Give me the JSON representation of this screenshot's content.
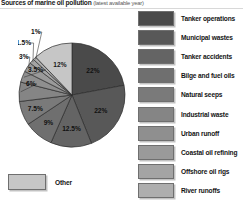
{
  "title": {
    "main": "Sources of marine oil pollution",
    "sub": "(latest available year)"
  },
  "chart_data": {
    "type": "pie",
    "title": "Sources of marine oil pollution (latest available year)",
    "xlabel": "",
    "ylabel": "",
    "legend_position": "right",
    "grid": false,
    "units": "percent",
    "categories": [
      "Tanker operations",
      "Municipal wastes",
      "Tanker accidents",
      "Bilge and fuel oils",
      "Natural seeps",
      "Industrial waste",
      "Urban runoff",
      "Coastal oil refining",
      "Offshore oil rigs",
      "River runoffs",
      "Other"
    ],
    "values": [
      22,
      22,
      12.5,
      9,
      7.5,
      6,
      3.5,
      3,
      1.5,
      1,
      12
    ],
    "labels": [
      "22%",
      "22%",
      "12.5%",
      "9%",
      "7.5%",
      "6%",
      "3.5%",
      "3%",
      "1.5%",
      "1%",
      "12%"
    ],
    "colors": [
      "#4a4a4a",
      "#585858",
      "#646464",
      "#6f6f6f",
      "#7a7a7a",
      "#858585",
      "#8f8f8f",
      "#9a9a9a",
      "#a4a4a4",
      "#aeaeae",
      "#c6c6c6"
    ]
  },
  "legend": {
    "items": [
      {
        "label": "Tanker operations",
        "color": "#4a4a4a"
      },
      {
        "label": "Municipal wastes",
        "color": "#585858"
      },
      {
        "label": "Tanker accidents",
        "color": "#646464"
      },
      {
        "label": "Bilge and fuel oils",
        "color": "#6f6f6f"
      },
      {
        "label": "Natural seeps",
        "color": "#7a7a7a"
      },
      {
        "label": "Industrial waste",
        "color": "#858585"
      },
      {
        "label": "Urban runoff",
        "color": "#8f8f8f"
      },
      {
        "label": "Coastal oil refining",
        "color": "#9a9a9a"
      },
      {
        "label": "Offshore oil rigs",
        "color": "#a4a4a4"
      },
      {
        "label": "River runoffs",
        "color": "#aeaeae"
      }
    ]
  },
  "other_key": {
    "label": "Other",
    "color": "#c6c6c6"
  }
}
